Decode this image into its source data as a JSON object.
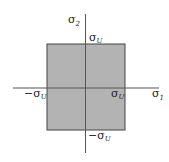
{
  "diagram": {
    "type": "failure-envelope",
    "region": {
      "fill": "#b3b3b3",
      "stroke": "#444444"
    },
    "axes": {
      "x_label": {
        "symbol": "σ",
        "subscript": "1"
      },
      "y_label": {
        "symbol": "σ",
        "subscript": "2"
      }
    },
    "labels": {
      "top": {
        "prefix": "",
        "symbol": "σ",
        "subscript": "U"
      },
      "right": {
        "prefix": "",
        "symbol": "σ",
        "subscript": "U"
      },
      "left": {
        "prefix": "−",
        "symbol": "σ",
        "subscript": "U"
      },
      "bottom": {
        "prefix": "−",
        "symbol": "σ",
        "subscript": "U"
      }
    }
  }
}
